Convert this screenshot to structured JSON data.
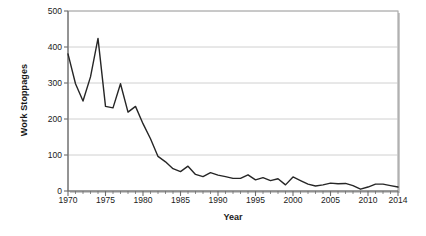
{
  "chart_data": {
    "type": "line",
    "title": "",
    "xlabel": "Year",
    "ylabel": "Work Stoppages",
    "xlim": [
      1970,
      2014
    ],
    "ylim": [
      0,
      500
    ],
    "grid": true,
    "legend": false,
    "y_ticks": [
      0,
      100,
      200,
      300,
      400,
      500
    ],
    "y_tick_labels": [
      "0",
      "100",
      "200",
      "300",
      "400",
      "500"
    ],
    "x_ticks": [
      1970,
      1975,
      1980,
      1985,
      1990,
      1995,
      2000,
      2005,
      2010,
      2014
    ],
    "x_tick_labels": [
      "1970",
      "1975",
      "1980",
      "1985",
      "1990",
      "1995",
      "2000",
      "2005",
      "2010",
      "2014"
    ],
    "x_minor_tick_step": 1,
    "series": [
      {
        "name": "Work Stoppages",
        "color": "#262626",
        "x": [
          1970,
          1971,
          1972,
          1973,
          1974,
          1975,
          1976,
          1977,
          1978,
          1979,
          1980,
          1981,
          1982,
          1983,
          1984,
          1985,
          1986,
          1987,
          1988,
          1989,
          1990,
          1991,
          1992,
          1993,
          1994,
          1995,
          1996,
          1997,
          1998,
          1999,
          2000,
          2001,
          2002,
          2003,
          2004,
          2005,
          2006,
          2007,
          2008,
          2009,
          2010,
          2011,
          2012,
          2013,
          2014
        ],
        "values": [
          381,
          298,
          250,
          317,
          424,
          235,
          231,
          298,
          219,
          235,
          187,
          145,
          96,
          81,
          62,
          54,
          69,
          46,
          40,
          51,
          44,
          40,
          35,
          35,
          45,
          31,
          37,
          29,
          34,
          17,
          39,
          29,
          19,
          14,
          17,
          22,
          20,
          21,
          15,
          5,
          11,
          19,
          19,
          15,
          11
        ]
      }
    ]
  },
  "axis": {
    "y_title": "Work Stoppages",
    "x_title": "Year"
  }
}
